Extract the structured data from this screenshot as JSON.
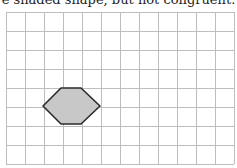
{
  "caption": "e shaded shape, but not congruent.",
  "grid": {
    "origin_x": 6,
    "origin_y": 12,
    "cell": 19,
    "cols": 12,
    "rows": 8,
    "line_color": "#bdbdbd"
  },
  "shape": {
    "type": "hexagon",
    "points": "43,106 61,88 81,88 100,106 81,124 61,124",
    "fill": "#c8c8c8",
    "stroke": "#2a2a2a"
  }
}
